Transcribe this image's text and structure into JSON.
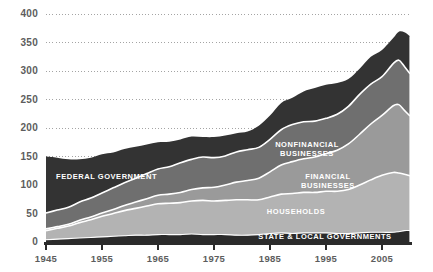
{
  "chart_data": {
    "type": "area",
    "title": "",
    "subtitle": "",
    "xlabel": "",
    "ylabel": "",
    "stacked": true,
    "grid": true,
    "grid_style": "dotted-horizontal",
    "legend_position": "inline-on-areas",
    "xlim": [
      1945,
      2010
    ],
    "ylim": [
      0,
      400
    ],
    "x_ticks": [
      "1945",
      "1955",
      "1965",
      "1975",
      "1985",
      "1995",
      "2005"
    ],
    "x_tick_values": [
      1945,
      1955,
      1965,
      1975,
      1985,
      1995,
      2005
    ],
    "y_ticks": [
      "0",
      "50",
      "100",
      "150",
      "200",
      "250",
      "300",
      "350",
      "400"
    ],
    "y_tick_values": [
      0,
      50,
      100,
      150,
      200,
      250,
      300,
      350,
      400
    ],
    "x": [
      1945,
      1947,
      1949,
      1951,
      1953,
      1955,
      1957,
      1959,
      1961,
      1963,
      1965,
      1967,
      1969,
      1971,
      1973,
      1975,
      1977,
      1979,
      1981,
      1983,
      1985,
      1987,
      1989,
      1991,
      1993,
      1995,
      1997,
      1999,
      2001,
      2003,
      2005,
      2007,
      2008,
      2009,
      2010
    ],
    "series": [
      {
        "name": "State & Local Governments",
        "label": "STATE & LOCAL GOVERNMENTS",
        "color": "#2b2b2b",
        "stack_order": 1,
        "values": [
          4,
          5,
          6,
          7,
          8,
          9,
          10,
          11,
          12,
          12,
          13,
          13,
          13,
          14,
          13,
          13,
          13,
          12,
          12,
          13,
          15,
          16,
          15,
          16,
          16,
          16,
          15,
          15,
          16,
          17,
          17,
          17,
          18,
          20,
          20
        ]
      },
      {
        "name": "Households",
        "label": "HOUSEHOLDS",
        "color": "#b3b3b3",
        "stack_order": 2,
        "values": [
          16,
          19,
          22,
          27,
          31,
          36,
          40,
          44,
          47,
          51,
          54,
          55,
          56,
          58,
          60,
          59,
          60,
          62,
          62,
          61,
          64,
          68,
          70,
          71,
          71,
          73,
          74,
          77,
          84,
          92,
          100,
          105,
          103,
          99,
          96
        ]
      },
      {
        "name": "Financial Businesses",
        "label": "FINANCIAL\nBUSINESSES",
        "color": "#9a9a9a",
        "stack_order": 3,
        "values": [
          3,
          3,
          3,
          4,
          5,
          6,
          7,
          9,
          11,
          13,
          15,
          16,
          18,
          20,
          22,
          24,
          27,
          31,
          34,
          38,
          44,
          51,
          56,
          59,
          62,
          66,
          72,
          80,
          89,
          98,
          105,
          117,
          120,
          112,
          105
        ]
      },
      {
        "name": "Nonfinancial Businesses",
        "label": "NONFINANCIAL\nBUSINESSES",
        "color": "#6f6f6f",
        "stack_order": 4,
        "values": [
          28,
          29,
          30,
          32,
          33,
          35,
          38,
          40,
          42,
          44,
          46,
          48,
          52,
          53,
          54,
          52,
          51,
          53,
          54,
          54,
          57,
          62,
          65,
          65,
          63,
          62,
          63,
          66,
          70,
          70,
          68,
          74,
          78,
          77,
          74
        ]
      },
      {
        "name": "Federal Government",
        "label": "FEDERAL GOVERNMENT",
        "color": "#333333",
        "stack_order": 5,
        "values": [
          99,
          92,
          84,
          75,
          71,
          68,
          62,
          59,
          55,
          51,
          47,
          44,
          41,
          40,
          35,
          36,
          36,
          33,
          32,
          38,
          42,
          47,
          47,
          53,
          58,
          59,
          55,
          48,
          45,
          48,
          47,
          45,
          50,
          60,
          66
        ]
      }
    ],
    "totals": [
      150,
      148,
      145,
      145,
      148,
      154,
      157,
      163,
      167,
      171,
      175,
      176,
      180,
      185,
      184,
      184,
      187,
      191,
      194,
      204,
      222,
      244,
      253,
      264,
      270,
      276,
      279,
      286,
      304,
      325,
      337,
      358,
      369,
      368,
      361
    ],
    "peak": {
      "year": 2008,
      "value": 369
    }
  },
  "labels": {
    "federal_government": "FEDERAL GOVERNMENT",
    "nonfinancial_businesses": "NONFINANCIAL\nBUSINESSES",
    "financial_businesses": "FINANCIAL\nBUSINESSES",
    "households": "HOUSEHOLDS",
    "state_local_governments": "STATE & LOCAL GOVERNMENTS"
  },
  "colors": {
    "background": "#ffffff",
    "axis": "#2b2b2b",
    "tick_text": "#5d5d5d",
    "gridline": "#9a9a9a",
    "label_text": "#ffffff",
    "federal_government": "#333333",
    "nonfinancial_businesses": "#6f6f6f",
    "financial_businesses": "#9a9a9a",
    "households": "#b3b3b3",
    "state_local_governments": "#2b2b2b"
  }
}
